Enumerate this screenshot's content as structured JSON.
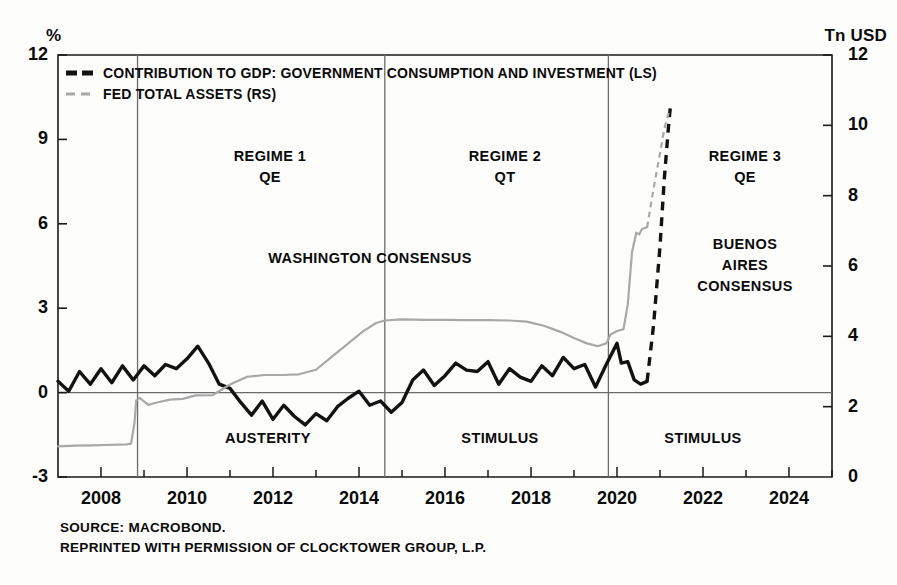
{
  "axis_units": {
    "left": "%",
    "right": "Tn USD"
  },
  "legend": [
    {
      "label": "CONTRIBUTION TO GDP: GOVERNMENT CONSUMPTION AND INVESTMENT (LS)",
      "color": "#121212",
      "style": "dashed-thick"
    },
    {
      "label": "FED TOTAL ASSETS (RS)",
      "color": "#a8a8a8",
      "style": "dashed-thin"
    }
  ],
  "annotations": [
    {
      "id": "regime-1",
      "text": "REGIME 1\nQE",
      "x": 270,
      "y": 146
    },
    {
      "id": "regime-2",
      "text": "REGIME 2\nQT",
      "x": 505,
      "y": 146
    },
    {
      "id": "regime-3",
      "text": "REGIME 3\nQE",
      "x": 745,
      "y": 146
    },
    {
      "id": "washington-consensus",
      "text": "WASHINGTON CONSENSUS",
      "x": 370,
      "y": 248
    },
    {
      "id": "buenos-aires-consensus",
      "text": "BUENOS\nAIRES\nCONSENSUS",
      "x": 745,
      "y": 234
    },
    {
      "id": "austerity",
      "text": "AUSTERITY",
      "x": 268,
      "y": 428
    },
    {
      "id": "stimulus-2",
      "text": "STIMULUS",
      "x": 500,
      "y": 428
    },
    {
      "id": "stimulus-3",
      "text": "STIMULUS",
      "x": 703,
      "y": 428
    }
  ],
  "source_lines": [
    "SOURCE: MACROBOND.",
    "REPRINTED WITH PERMISSION OF CLOCKTOWER GROUP, L.P."
  ],
  "chart_data": {
    "type": "line",
    "title": "",
    "xlabel": "",
    "ylabel": "%",
    "y2label": "Tn USD",
    "grid": false,
    "legend_position": "top-left",
    "xlim": [
      2007.0,
      2025.0
    ],
    "xticks": [
      2008,
      2010,
      2012,
      2014,
      2016,
      2018,
      2020,
      2022,
      2024
    ],
    "xtick_labels": [
      "2008",
      "2010",
      "2012",
      "2014",
      "2016",
      "2018",
      "2020",
      "2022",
      "2024"
    ],
    "ylim": [
      -3,
      12
    ],
    "yticks": [
      -3,
      0,
      3,
      6,
      9,
      12
    ],
    "ytick_labels": [
      "-3",
      "0",
      "3",
      "6",
      "9",
      "12"
    ],
    "y2lim": [
      0,
      12
    ],
    "y2ticks": [
      0,
      2,
      4,
      6,
      8,
      10,
      12
    ],
    "y2tick_labels": [
      "0",
      "2",
      "4",
      "6",
      "8",
      "10",
      "12"
    ],
    "zero_line": 0,
    "regime_dividers": [
      2008.85,
      2014.6,
      2019.8
    ],
    "series": [
      {
        "name": "CONTRIBUTION TO GDP: GOVERNMENT CONSUMPTION AND INVESTMENT (LS)",
        "axis": "left",
        "color": "#121212",
        "width": 3.4,
        "points": [
          [
            2007.0,
            0.4
          ],
          [
            2007.25,
            0.05
          ],
          [
            2007.5,
            0.75
          ],
          [
            2007.75,
            0.3
          ],
          [
            2008.0,
            0.85
          ],
          [
            2008.25,
            0.35
          ],
          [
            2008.5,
            0.95
          ],
          [
            2008.75,
            0.45
          ],
          [
            2009.0,
            0.95
          ],
          [
            2009.25,
            0.6
          ],
          [
            2009.5,
            1.0
          ],
          [
            2009.75,
            0.85
          ],
          [
            2010.0,
            1.2
          ],
          [
            2010.25,
            1.65
          ],
          [
            2010.5,
            1.05
          ],
          [
            2010.75,
            0.3
          ],
          [
            2011.0,
            0.15
          ],
          [
            2011.25,
            -0.35
          ],
          [
            2011.5,
            -0.8
          ],
          [
            2011.75,
            -0.3
          ],
          [
            2012.0,
            -0.95
          ],
          [
            2012.25,
            -0.45
          ],
          [
            2012.5,
            -0.85
          ],
          [
            2012.75,
            -1.15
          ],
          [
            2013.0,
            -0.75
          ],
          [
            2013.25,
            -1.0
          ],
          [
            2013.5,
            -0.5
          ],
          [
            2013.75,
            -0.2
          ],
          [
            2014.0,
            0.05
          ],
          [
            2014.25,
            -0.45
          ],
          [
            2014.5,
            -0.3
          ],
          [
            2014.75,
            -0.7
          ],
          [
            2015.0,
            -0.35
          ],
          [
            2015.25,
            0.45
          ],
          [
            2015.5,
            0.8
          ],
          [
            2015.75,
            0.25
          ],
          [
            2016.0,
            0.6
          ],
          [
            2016.25,
            1.05
          ],
          [
            2016.5,
            0.8
          ],
          [
            2016.75,
            0.75
          ],
          [
            2017.0,
            1.1
          ],
          [
            2017.25,
            0.3
          ],
          [
            2017.5,
            0.85
          ],
          [
            2017.75,
            0.55
          ],
          [
            2018.0,
            0.4
          ],
          [
            2018.25,
            0.95
          ],
          [
            2018.5,
            0.6
          ],
          [
            2018.75,
            1.25
          ],
          [
            2019.0,
            0.85
          ],
          [
            2019.25,
            1.0
          ],
          [
            2019.5,
            0.2
          ],
          [
            2019.75,
            1.0
          ],
          [
            2020.0,
            1.75
          ],
          [
            2020.1,
            1.05
          ],
          [
            2020.25,
            1.1
          ],
          [
            2020.4,
            0.45
          ],
          [
            2020.55,
            0.3
          ],
          [
            2020.7,
            0.4
          ]
        ],
        "forecast_points": [
          [
            2020.7,
            0.4
          ],
          [
            2020.85,
            2.4
          ],
          [
            2021.0,
            5.2
          ],
          [
            2021.1,
            7.6
          ],
          [
            2021.2,
            9.5
          ],
          [
            2021.25,
            10.3
          ]
        ]
      },
      {
        "name": "FED TOTAL ASSETS (RS)",
        "axis": "right",
        "color": "#a8a8a8",
        "width": 2.2,
        "points": [
          [
            2007.0,
            0.87
          ],
          [
            2007.4,
            0.89
          ],
          [
            2007.8,
            0.9
          ],
          [
            2008.1,
            0.91
          ],
          [
            2008.4,
            0.92
          ],
          [
            2008.6,
            0.93
          ],
          [
            2008.7,
            0.95
          ],
          [
            2008.78,
            1.55
          ],
          [
            2008.82,
            2.18
          ],
          [
            2008.9,
            2.25
          ],
          [
            2009.1,
            2.05
          ],
          [
            2009.3,
            2.12
          ],
          [
            2009.6,
            2.2
          ],
          [
            2009.9,
            2.22
          ],
          [
            2010.2,
            2.32
          ],
          [
            2010.6,
            2.33
          ],
          [
            2011.0,
            2.63
          ],
          [
            2011.4,
            2.85
          ],
          [
            2011.8,
            2.9
          ],
          [
            2012.2,
            2.9
          ],
          [
            2012.6,
            2.92
          ],
          [
            2013.0,
            3.05
          ],
          [
            2013.4,
            3.45
          ],
          [
            2013.8,
            3.85
          ],
          [
            2014.1,
            4.15
          ],
          [
            2014.4,
            4.38
          ],
          [
            2014.6,
            4.45
          ],
          [
            2015.0,
            4.48
          ],
          [
            2015.5,
            4.47
          ],
          [
            2016.0,
            4.47
          ],
          [
            2016.5,
            4.46
          ],
          [
            2017.0,
            4.46
          ],
          [
            2017.5,
            4.45
          ],
          [
            2017.9,
            4.42
          ],
          [
            2018.3,
            4.3
          ],
          [
            2018.7,
            4.12
          ],
          [
            2019.0,
            3.95
          ],
          [
            2019.3,
            3.8
          ],
          [
            2019.55,
            3.72
          ],
          [
            2019.75,
            3.8
          ],
          [
            2019.85,
            4.05
          ],
          [
            2020.0,
            4.15
          ],
          [
            2020.15,
            4.2
          ],
          [
            2020.25,
            4.9
          ],
          [
            2020.35,
            6.4
          ],
          [
            2020.45,
            6.95
          ],
          [
            2020.52,
            6.9
          ],
          [
            2020.58,
            7.05
          ],
          [
            2020.7,
            7.1
          ]
        ],
        "forecast_points": [
          [
            2020.7,
            7.1
          ],
          [
            2020.85,
            8.2
          ],
          [
            2021.0,
            9.2
          ],
          [
            2021.1,
            9.9
          ],
          [
            2021.2,
            10.35
          ]
        ]
      }
    ]
  }
}
